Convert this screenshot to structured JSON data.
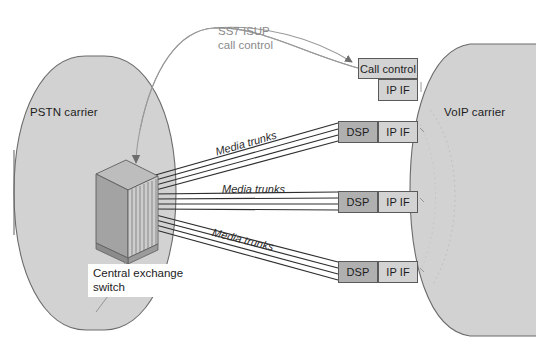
{
  "diagram": {
    "background_color": "#ffffff",
    "clouds": [
      {
        "id": "pstn",
        "label": "PSTN carrier",
        "fill": "#d2d2d2",
        "stroke": "#666666"
      },
      {
        "id": "voip",
        "label": "VoIP carrier",
        "fill": "#d2d2d2",
        "stroke": "#666666"
      }
    ],
    "signalling": {
      "label_line1": "SS7 ISUP",
      "label_line2": "call control",
      "color": "#8a8a8a",
      "arrow_color": "#6e6e6e"
    },
    "switch": {
      "label_line1": "Central exchange",
      "label_line2": "switch",
      "top_face_color": "#b8b8b8",
      "front_face_color": "#c9c9c9",
      "side_face_color": "#9a9a9a"
    },
    "gateway_rows": [
      {
        "id": "row-1",
        "trunk_label": "Media trunks",
        "dsp_label": "DSP",
        "ip_if_label": "IP IF",
        "dsp_color": "#b0b0b0",
        "ip_if_color": "#d3d3d3"
      },
      {
        "id": "row-2",
        "trunk_label": "Media trunks",
        "dsp_label": "DSP",
        "ip_if_label": "IP IF",
        "dsp_color": "#b0b0b0",
        "ip_if_color": "#d3d3d3"
      },
      {
        "id": "row-3",
        "trunk_label": "Media trunks",
        "dsp_label": "DSP",
        "ip_if_label": "IP IF",
        "dsp_color": "#b0b0b0",
        "ip_if_color": "#d3d3d3"
      }
    ],
    "call_control": {
      "label": "Call control",
      "ip_if_label": "IP IF",
      "box_color": "#d3d3d3",
      "ip_if_color": "#d3d3d3"
    }
  }
}
